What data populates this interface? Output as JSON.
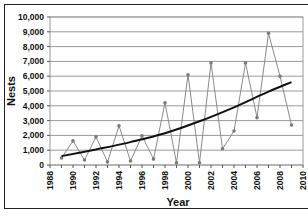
{
  "chart_data": {
    "type": "line",
    "title": "",
    "xlabel": "Year",
    "ylabel": "Nests",
    "xlim": [
      1988,
      2010
    ],
    "ylim": [
      0,
      10000
    ],
    "x_ticks": [
      "1988",
      "1990",
      "1992",
      "1994",
      "1996",
      "1998",
      "2000",
      "2002",
      "2004",
      "2006",
      "2008",
      "2010"
    ],
    "y_ticks": [
      "0",
      "1,000",
      "2,000",
      "3,000",
      "4,000",
      "5,000",
      "6,000",
      "7,000",
      "8,000",
      "9,000",
      "10,000"
    ],
    "grid": "horizontal",
    "legend": null,
    "series": [
      {
        "name": "Nests",
        "style": "gray line with markers",
        "color": "#8a8a8a",
        "x": [
          1989,
          1990,
          1991,
          1992,
          1993,
          1994,
          1995,
          1996,
          1997,
          1998,
          1999,
          2000,
          2001,
          2002,
          2003,
          2004,
          2005,
          2006,
          2007,
          2008,
          2009
        ],
        "values": [
          470,
          1630,
          340,
          1900,
          200,
          2650,
          270,
          1970,
          400,
          4200,
          150,
          6100,
          150,
          6900,
          1100,
          2300,
          6900,
          3200,
          8900,
          6000,
          2700
        ]
      },
      {
        "name": "Exponential trend",
        "style": "black thick curve",
        "color": "#111111",
        "x": [
          1989,
          1992,
          1995,
          1998,
          2001,
          2004,
          2007,
          2009
        ],
        "values": [
          600,
          1050,
          1550,
          2150,
          2950,
          3900,
          4950,
          5600
        ]
      }
    ]
  },
  "colors": {
    "grid": "#9a9a9a",
    "data_line": "#8a8a8a",
    "marker": "#7a7a7a",
    "trend": "#111111",
    "frame": "#222222"
  }
}
